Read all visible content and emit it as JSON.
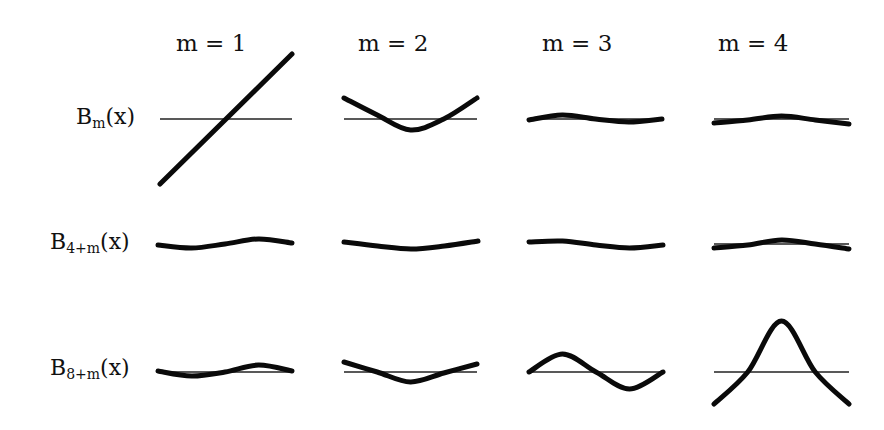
{
  "chart_data": {
    "type": "line",
    "title": "",
    "columns": [
      {
        "label": "m = 1",
        "x": 176
      },
      {
        "label": "m = 2",
        "x": 358
      },
      {
        "label": "m = 3",
        "x": 542
      },
      {
        "label": "m = 4",
        "x": 718
      }
    ],
    "rows": [
      {
        "base": "B",
        "sub": "m",
        "arg": "(x)",
        "label_y": 104,
        "axis_y": 119
      },
      {
        "base": "B",
        "sub": "4+m",
        "arg": "(x)",
        "label_y": 229,
        "axis_y": 244
      },
      {
        "base": "B",
        "sub": "8+m",
        "arg": "(x)",
        "label_y": 355,
        "axis_y": 372
      }
    ],
    "cells": [
      [
        {
          "x0": 160,
          "x1": 292,
          "show_axis": true,
          "y": [
            65,
            32,
            0,
            -32,
            -65
          ]
        },
        {
          "x0": 344,
          "x1": 477,
          "show_axis": true,
          "y": [
            -21,
            -4,
            11,
            0,
            -21
          ]
        },
        {
          "x0": 529,
          "x1": 662,
          "show_axis": true,
          "y": [
            1,
            -4,
            0,
            3,
            0
          ]
        },
        {
          "x0": 714,
          "x1": 849,
          "show_axis": true,
          "y": [
            4,
            1,
            -3,
            1,
            5
          ]
        }
      ],
      [
        {
          "x0": 158,
          "x1": 292,
          "show_axis": false,
          "y": [
            1,
            4,
            0,
            -5,
            -1
          ]
        },
        {
          "x0": 344,
          "x1": 478,
          "show_axis": false,
          "y": [
            -2,
            2,
            5,
            2,
            -3
          ]
        },
        {
          "x0": 529,
          "x1": 663,
          "show_axis": false,
          "y": [
            -2,
            -3,
            1,
            4,
            1
          ]
        },
        {
          "x0": 714,
          "x1": 849,
          "show_axis": true,
          "y": [
            4,
            1,
            -4,
            0,
            5
          ]
        }
      ],
      [
        {
          "x0": 158,
          "x1": 292,
          "show_axis": true,
          "y": [
            -1,
            4,
            0,
            -7,
            -1
          ]
        },
        {
          "x0": 344,
          "x1": 477,
          "show_axis": true,
          "y": [
            -10,
            0,
            10,
            1,
            -8
          ]
        },
        {
          "x0": 529,
          "x1": 663,
          "show_axis": true,
          "y": [
            0,
            -18,
            0,
            17,
            0
          ]
        },
        {
          "x0": 714,
          "x1": 849,
          "show_axis": true,
          "y": [
            32,
            0,
            -51,
            0,
            32
          ]
        }
      ]
    ],
    "xlabel": "",
    "ylabel": "",
    "grid": false,
    "legend": null
  }
}
